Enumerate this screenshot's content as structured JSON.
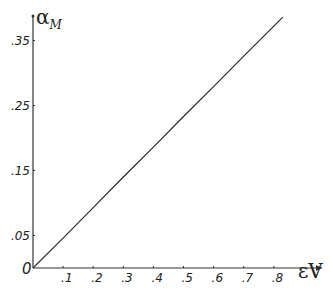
{
  "chart_data": {
    "type": "line",
    "title": "",
    "xlabel": "εV",
    "ylabel": "α_M",
    "ylabel_main": "α",
    "ylabel_sub": "M",
    "origin_label": "0",
    "x_ticks": [
      0.1,
      0.2,
      0.3,
      0.4,
      0.5,
      0.6,
      0.7,
      0.8
    ],
    "x_tick_labels": [
      ".1",
      ".2",
      ".3",
      ".4",
      ".5",
      ".6",
      ".7",
      ".8"
    ],
    "y_ticks": [
      0.05,
      0.15,
      0.25,
      0.35
    ],
    "y_tick_labels": [
      ".05",
      ".15",
      ".25",
      ".35"
    ],
    "xlim": [
      0,
      0.88
    ],
    "ylim": [
      0,
      0.39
    ],
    "grid": false,
    "legend": null,
    "series": [
      {
        "name": "α_M vs εV",
        "x": [
          0,
          0.1,
          0.2,
          0.3,
          0.4,
          0.5,
          0.6,
          0.7,
          0.8,
          0.83
        ],
        "y": [
          0,
          0.046,
          0.093,
          0.14,
          0.186,
          0.233,
          0.279,
          0.326,
          0.372,
          0.386
        ]
      }
    ],
    "colors": {
      "line": "#222222",
      "axis": "#333333"
    }
  }
}
